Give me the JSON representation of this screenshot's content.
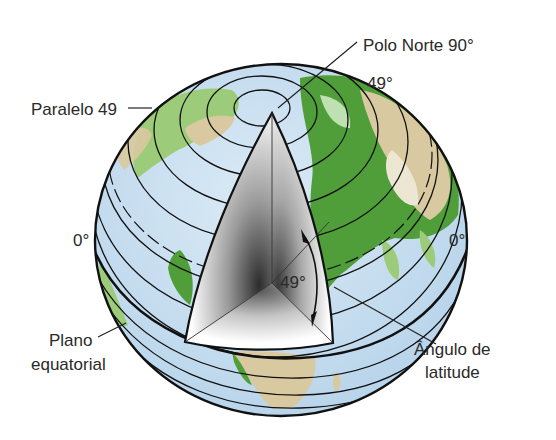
{
  "diagram": {
    "labels": {
      "north_pole": "Polo Norte 90°",
      "parallel": "Paralelo 49",
      "parallel_degree": "49°",
      "equator_left": "0°",
      "equator_right": "0°",
      "inner_angle": "49°",
      "equatorial_plane_line1": "Plano",
      "equatorial_plane_line2": "equatorial",
      "latitude_angle_line1": "Ângulo de",
      "latitude_angle_line2": "latitude"
    },
    "colors": {
      "ocean": "#c9e0f0",
      "land_green": "#4f9e3a",
      "land_light_green": "#9ccb7a",
      "land_tan": "#d9c9a0",
      "line": "#111111",
      "cut_face_light": "#ffffff",
      "cut_face_dark": "#3a3a3a",
      "text": "#2a2a2a",
      "background": "#ffffff"
    }
  }
}
